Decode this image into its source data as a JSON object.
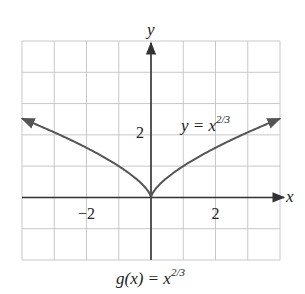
{
  "chart_data": {
    "type": "line",
    "caption": {
      "func": "g(x) = x",
      "exp": "2/3"
    },
    "xlabel": "x",
    "ylabel": "y",
    "xlim": [
      -4,
      4
    ],
    "ylim": [
      -2,
      5
    ],
    "grid": true,
    "grid_step": 1,
    "x_tick_labels": [
      {
        "value": -2,
        "label": "−2"
      },
      {
        "value": 2,
        "label": "2"
      }
    ],
    "y_tick_labels": [
      {
        "value": 2,
        "label": "2"
      }
    ],
    "series": [
      {
        "name": "y = x^(2/3)",
        "label_base": "y = x",
        "label_exp": "2/3",
        "function": "x^(2/3)",
        "x": [
          -4,
          -3,
          -2,
          -1,
          -0.5,
          0,
          0.5,
          1,
          2,
          3,
          4
        ],
        "y": [
          2.52,
          2.08,
          1.59,
          1.0,
          0.63,
          0,
          0.63,
          1.0,
          1.59,
          2.08,
          2.52
        ],
        "arrows_at_ends": true
      }
    ],
    "colors": {
      "curve": "#555555",
      "axes": "#333333",
      "grid": "#c8c8c8"
    }
  }
}
